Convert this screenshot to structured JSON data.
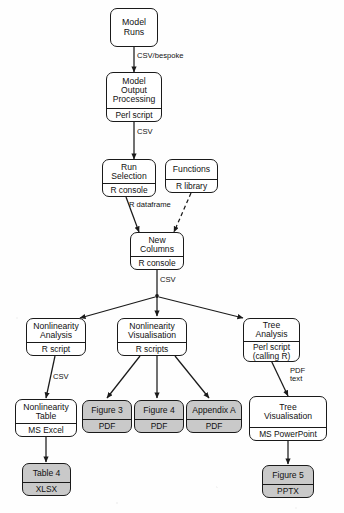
{
  "diagram": {
    "colors": {
      "stroke": "#1a1a1a",
      "process_fill": "#ffffff",
      "output_fill": "#c9c9c9",
      "background": "#fefefe"
    },
    "nodes": [
      {
        "id": "model-runs",
        "title": "Model\nRuns",
        "sub": "",
        "shaded": false
      },
      {
        "id": "model-output-processing",
        "title": "Model\nOutput\nProcessing",
        "sub": "Perl script",
        "shaded": false
      },
      {
        "id": "run-selection",
        "title": "Run\nSelection",
        "sub": "R console",
        "shaded": false
      },
      {
        "id": "functions",
        "title": "Functions",
        "sub": "R library",
        "shaded": false
      },
      {
        "id": "new-columns",
        "title": "New\nColumns",
        "sub": "R console",
        "shaded": false
      },
      {
        "id": "nonlinearity-analysis",
        "title": "Nonlinearity\nAnalysis",
        "sub": "R script",
        "shaded": false
      },
      {
        "id": "nonlinearity-visualisation",
        "title": "Nonlinearity\nVisualisation",
        "sub": "R scripts",
        "shaded": false
      },
      {
        "id": "tree-analysis",
        "title": "Tree\nAnalysis",
        "sub": "Perl script\n(calling R)",
        "shaded": false
      },
      {
        "id": "nonlinearity-table",
        "title": "Nonlinearity\nTable",
        "sub": "MS Excel",
        "shaded": false
      },
      {
        "id": "figure-3",
        "title": "Figure 3",
        "sub": "PDF",
        "shaded": true
      },
      {
        "id": "figure-4",
        "title": "Figure 4",
        "sub": "PDF",
        "shaded": true
      },
      {
        "id": "appendix-a",
        "title": "Appendix A",
        "sub": "PDF",
        "shaded": true
      },
      {
        "id": "tree-visualisation",
        "title": "Tree\nVisualisation",
        "sub": "MS PowerPoint",
        "shaded": false
      },
      {
        "id": "table-4",
        "title": "Table 4",
        "sub": "XLSX",
        "shaded": true
      },
      {
        "id": "figure-5",
        "title": "Figure 5",
        "sub": "PPTX",
        "shaded": true
      }
    ],
    "edge_labels": [
      {
        "id": "csv-bespoke",
        "text": "CSV/bespoke"
      },
      {
        "id": "csv-to-run-sel",
        "text": "CSV"
      },
      {
        "id": "r-dataframe",
        "text": "R dataframe"
      },
      {
        "id": "csv-to-branches",
        "text": "CSV"
      },
      {
        "id": "csv-to-nl-table",
        "text": "CSV"
      },
      {
        "id": "pdf-text",
        "text": "PDF\ntext"
      }
    ]
  }
}
